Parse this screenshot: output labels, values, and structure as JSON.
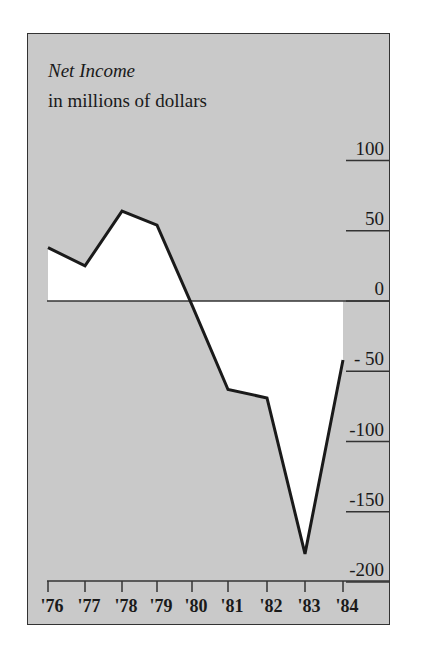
{
  "chart_data": {
    "type": "line",
    "title": "Net Income",
    "subtitle": "in millions of dollars",
    "xlabel": "",
    "ylabel": "in millions of dollars",
    "categories": [
      "'76",
      "'77",
      "'78",
      "'79",
      "'80",
      "'81",
      "'82",
      "'83",
      "'84"
    ],
    "values": [
      38,
      25,
      64,
      54,
      -3,
      -63,
      -69,
      -180,
      -42
    ],
    "y_ticks": [
      100,
      50,
      0,
      -50,
      -100,
      -150,
      -200
    ],
    "y_tick_labels": [
      "100",
      "50",
      "0",
      "- 50",
      "-100",
      "-150",
      "-200"
    ],
    "ylim": [
      -200,
      120
    ],
    "fill": "white area between line and zero",
    "grid": false,
    "legend": null
  },
  "colors": {
    "background": "#c9c9c9",
    "fill": "#ffffff",
    "line": "#1a1a1a"
  }
}
